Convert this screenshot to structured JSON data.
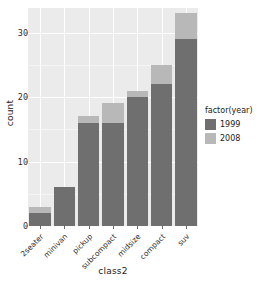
{
  "chart_data": {
    "type": "bar",
    "stacked": true,
    "title": "",
    "xlabel": "class2",
    "ylabel": "count",
    "categories": [
      "2seater",
      "minivan",
      "pickup",
      "subcompact",
      "midsize",
      "compact",
      "suv"
    ],
    "series": [
      {
        "name": "1999",
        "color": "#6f6f6f",
        "values": [
          2,
          6,
          16,
          16,
          20,
          22,
          29
        ]
      },
      {
        "name": "2008",
        "color": "#b8b8b8",
        "values": [
          1,
          0,
          1,
          3,
          1,
          3,
          4
        ]
      }
    ],
    "totals": [
      3,
      6,
      17,
      19,
      21,
      25,
      33
    ],
    "ylim": [
      0,
      33.8
    ],
    "yticks": [
      0,
      10,
      20,
      30
    ],
    "ytick_labels": [
      "0",
      "10",
      "20",
      "30"
    ],
    "grid": true,
    "legend": {
      "title": "factor(year)",
      "position": "right",
      "entries": [
        {
          "label": "1999",
          "color": "#6f6f6f"
        },
        {
          "label": "2008",
          "color": "#b8b8b8"
        }
      ]
    },
    "panel_background": "#ebebeb",
    "grid_color": "#ffffff"
  }
}
